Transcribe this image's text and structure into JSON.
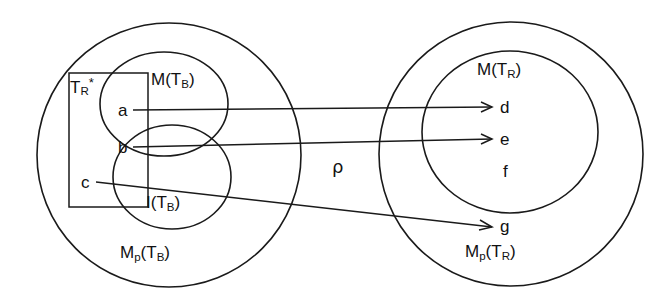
{
  "diagram": {
    "relation_symbol": "ρ",
    "left_group": {
      "outer_set": {
        "base": "M",
        "sub": "p",
        "arg_base": "T",
        "arg_sub": "B",
        "text": "Mp(TB)"
      },
      "upper_set": {
        "base": "M",
        "sub": "",
        "arg_base": "T",
        "arg_sub": "B",
        "text": "M(TB)"
      },
      "lower_set": {
        "base": "I",
        "sub": "",
        "arg_base": "T",
        "arg_sub": "B",
        "text": "I(TB)"
      },
      "box_label": {
        "base": "T",
        "sub": "R",
        "sup": "*",
        "text": "TR*"
      },
      "elements": [
        {
          "id": "a",
          "label": "a"
        },
        {
          "id": "b",
          "label": "b"
        },
        {
          "id": "c",
          "label": "c"
        }
      ]
    },
    "right_group": {
      "outer_set": {
        "base": "M",
        "sub": "p",
        "arg_base": "T",
        "arg_sub": "R",
        "text": "Mp(TR)"
      },
      "inner_set": {
        "base": "M",
        "sub": "",
        "arg_base": "T",
        "arg_sub": "R",
        "text": "M(TR)"
      },
      "elements": [
        {
          "id": "d",
          "label": "d"
        },
        {
          "id": "e",
          "label": "e"
        },
        {
          "id": "f",
          "label": "f"
        },
        {
          "id": "g",
          "label": "g"
        }
      ]
    },
    "mappings": [
      {
        "from": "a",
        "to": "d"
      },
      {
        "from": "b",
        "to": "e"
      },
      {
        "from": "c",
        "to": "g"
      }
    ],
    "colors": {
      "stroke": "#1a1a1a",
      "text": "#111111",
      "background": "#ffffff"
    }
  }
}
